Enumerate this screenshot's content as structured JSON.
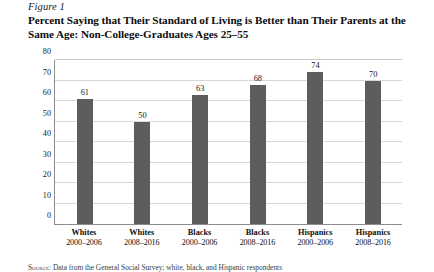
{
  "figure": {
    "label": "Figure 1",
    "title_line1": "Percent Saying that Their Standard of Living is Better than Their Parents at the",
    "title_line2": "Same Age: Non-College-Graduates Ages 25–55"
  },
  "source_note": {
    "prefix": "Source:",
    "text": "Data from the General Social Survey; white, black, and Hispanic respondents"
  },
  "chart_data": {
    "type": "bar",
    "title": "Percent Saying that Their Standard of Living is Better than Their Parents at the Same Age: Non-College-Graduates Ages 25–55",
    "xlabel": "",
    "ylabel": "",
    "ylim": [
      0,
      80
    ],
    "yticks": [
      0,
      10,
      20,
      30,
      40,
      50,
      60,
      70,
      80
    ],
    "ytick_labels": [
      "0",
      "10",
      "20",
      "30",
      "40",
      "50",
      "60",
      "70",
      "80"
    ],
    "grid": true,
    "legend": false,
    "bar_color": "#5d5d5d",
    "categories": [
      {
        "group": "Whites",
        "period": "2000–2006"
      },
      {
        "group": "Whites",
        "period": "2008–2016"
      },
      {
        "group": "Blacks",
        "period": "2000–2006"
      },
      {
        "group": "Blacks",
        "period": "2008–2016"
      },
      {
        "group": "Hispanics",
        "period": "2000–2006"
      },
      {
        "group": "Hispanics",
        "period": "2008–2016"
      }
    ],
    "values": [
      61,
      50,
      63,
      68,
      74,
      70
    ],
    "value_labels": [
      "61",
      "50",
      "63",
      "68",
      "74",
      "70"
    ]
  }
}
